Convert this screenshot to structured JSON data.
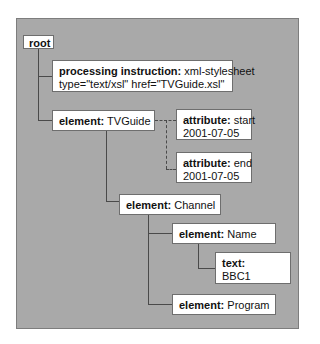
{
  "diagram": {
    "type": "xml-node-tree",
    "nodes": {
      "root": {
        "label": "root"
      },
      "pi": {
        "kind": "processing instruction:",
        "value_line1": "xml-stylesheet",
        "value_line2": "type=\"text/xsl\" href=\"TVGuide.xsl\""
      },
      "tvguide": {
        "kind": "element:",
        "value": "TVGuide"
      },
      "attr_start": {
        "kind": "attribute:",
        "value_line1": "start",
        "value_line2": "2001-07-05"
      },
      "attr_end": {
        "kind": "attribute:",
        "value_line1": "end",
        "value_line2": "2001-07-05"
      },
      "channel": {
        "kind": "element:",
        "value": "Channel"
      },
      "name": {
        "kind": "element:",
        "value": "Name"
      },
      "text": {
        "kind": "text:",
        "value": "BBC1"
      },
      "program": {
        "kind": "element:",
        "value": "Program"
      }
    },
    "edges": [
      {
        "from": "root",
        "to": "pi",
        "style": "solid"
      },
      {
        "from": "root",
        "to": "tvguide",
        "style": "solid"
      },
      {
        "from": "tvguide",
        "to": "attr_start",
        "style": "dashed"
      },
      {
        "from": "tvguide",
        "to": "attr_end",
        "style": "dashed"
      },
      {
        "from": "tvguide",
        "to": "channel",
        "style": "solid"
      },
      {
        "from": "channel",
        "to": "name",
        "style": "solid"
      },
      {
        "from": "name",
        "to": "text",
        "style": "solid"
      },
      {
        "from": "channel",
        "to": "program",
        "style": "solid"
      }
    ],
    "colors": {
      "panel": "#a9a9a9",
      "node_fill": "#ffffff",
      "line": "#4a4a4a"
    }
  }
}
